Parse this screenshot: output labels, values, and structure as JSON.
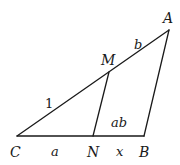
{
  "diagram": {
    "type": "geometry-triangle",
    "points": {
      "A": {
        "label": "A",
        "x": 169,
        "y": 30
      },
      "B": {
        "label": "B",
        "x": 144,
        "y": 136
      },
      "C": {
        "label": "C",
        "x": 17,
        "y": 136
      },
      "M": {
        "label": "M",
        "x": 109,
        "y": 72
      },
      "N": {
        "label": "N",
        "x": 93,
        "y": 136
      }
    },
    "segments": [
      {
        "from": "C",
        "to": "A"
      },
      {
        "from": "C",
        "to": "B"
      },
      {
        "from": "A",
        "to": "B"
      },
      {
        "from": "M",
        "to": "N"
      }
    ],
    "labels": {
      "vertex_A": "A",
      "vertex_B": "B",
      "vertex_C": "C",
      "vertex_M": "M",
      "vertex_N": "N",
      "length_CM": "1",
      "length_MA": "b",
      "length_CN": "a",
      "length_NB": "x",
      "area_MNBA": "ab"
    }
  }
}
